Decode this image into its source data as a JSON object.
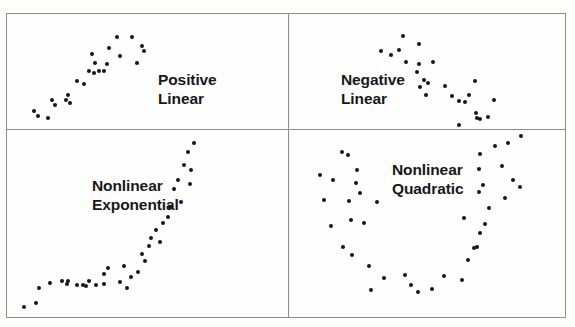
{
  "figure": {
    "type": "scatterplot-matrix",
    "colors": {
      "background": "#fdfdfc",
      "panel_background": "#fefefe",
      "border": "#8d8d8d",
      "dot": "#161616",
      "label_text": "#18181a"
    },
    "grid": {
      "rows": 2,
      "columns": 2
    }
  },
  "panels": [
    {
      "id": "positive-linear",
      "position": "top-left",
      "label_lines": [
        "Positive",
        "Linear"
      ],
      "label_line_1": "Positive",
      "label_line_2": "Linear",
      "points": [
        [
          26,
          96
        ],
        [
          30,
          101
        ],
        [
          40,
          103
        ],
        [
          44,
          85
        ],
        [
          47,
          90
        ],
        [
          58,
          85
        ],
        [
          60,
          80
        ],
        [
          62,
          88
        ],
        [
          69,
          66
        ],
        [
          76,
          69
        ],
        [
          81,
          56
        ],
        [
          86,
          58
        ],
        [
          91,
          56
        ],
        [
          96,
          56
        ],
        [
          84,
          39
        ],
        [
          87,
          48
        ],
        [
          99,
          49
        ],
        [
          101,
          33
        ],
        [
          109,
          22
        ],
        [
          112,
          41
        ],
        [
          124,
          22
        ],
        [
          129,
          48
        ],
        [
          134,
          31
        ],
        [
          136,
          36
        ]
      ]
    },
    {
      "id": "negative-linear",
      "position": "top-right",
      "label_lines": [
        "Negative",
        "Linear"
      ],
      "label_line_1": "Negative",
      "label_line_2": "Linear",
      "points": [
        [
          92,
          36
        ],
        [
          102,
          40
        ],
        [
          110,
          35
        ],
        [
          114,
          21
        ],
        [
          117,
          47
        ],
        [
          130,
          29
        ],
        [
          128,
          57
        ],
        [
          130,
          49
        ],
        [
          144,
          47
        ],
        [
          135,
          65
        ],
        [
          131,
          72
        ],
        [
          137,
          80
        ],
        [
          139,
          68
        ],
        [
          156,
          71
        ],
        [
          163,
          81
        ],
        [
          170,
          86
        ],
        [
          176,
          87
        ],
        [
          180,
          80
        ],
        [
          186,
          66
        ],
        [
          187,
          98
        ],
        [
          188,
          103
        ],
        [
          191,
          104
        ],
        [
          199,
          102
        ],
        [
          205,
          85
        ],
        [
          170,
          110
        ]
      ]
    },
    {
      "id": "nonlinear-exponential",
      "position": "bottom-left",
      "label_lines": [
        "Nonlinear",
        "Exponential"
      ],
      "label_line_1": "Nonlinear",
      "label_line_2": "Exponential",
      "points": [
        [
          16,
          177
        ],
        [
          28,
          173
        ],
        [
          31,
          158
        ],
        [
          42,
          153
        ],
        [
          54,
          151
        ],
        [
          59,
          154
        ],
        [
          60,
          151
        ],
        [
          69,
          155
        ],
        [
          75,
          155
        ],
        [
          78,
          156
        ],
        [
          81,
          151
        ],
        [
          88,
          155
        ],
        [
          96,
          154
        ],
        [
          96,
          144
        ],
        [
          100,
          138
        ],
        [
          112,
          152
        ],
        [
          116,
          136
        ],
        [
          119,
          158
        ],
        [
          123,
          147
        ],
        [
          130,
          142
        ],
        [
          134,
          124
        ],
        [
          137,
          131
        ],
        [
          141,
          116
        ],
        [
          143,
          108
        ],
        [
          148,
          100
        ],
        [
          152,
          112
        ],
        [
          155,
          93
        ],
        [
          160,
          87
        ],
        [
          162,
          77
        ],
        [
          166,
          59
        ],
        [
          170,
          50
        ],
        [
          173,
          72
        ],
        [
          176,
          35
        ],
        [
          180,
          22
        ],
        [
          182,
          54
        ],
        [
          183,
          40
        ],
        [
          186,
          13
        ]
      ]
    },
    {
      "id": "nonlinear-quadratic",
      "position": "bottom-right",
      "label_lines": [
        "Nonlinear",
        "Quadratic"
      ],
      "label_line_1": "Nonlinear",
      "label_line_2": "Quadratic",
      "points": [
        [
          31,
          45
        ],
        [
          53,
          22
        ],
        [
          59,
          25
        ],
        [
          44,
          50
        ],
        [
          68,
          40
        ],
        [
          67,
          53
        ],
        [
          71,
          63
        ],
        [
          35,
          70
        ],
        [
          60,
          71
        ],
        [
          88,
          72
        ],
        [
          62,
          90
        ],
        [
          42,
          96
        ],
        [
          75,
          93
        ],
        [
          54,
          117
        ],
        [
          63,
          125
        ],
        [
          80,
          136
        ],
        [
          95,
          148
        ],
        [
          82,
          160
        ],
        [
          116,
          145
        ],
        [
          122,
          155
        ],
        [
          129,
          162
        ],
        [
          155,
          146
        ],
        [
          143,
          159
        ],
        [
          173,
          150
        ],
        [
          179,
          130
        ],
        [
          185,
          118
        ],
        [
          188,
          117
        ],
        [
          175,
          88
        ],
        [
          191,
          103
        ],
        [
          196,
          94
        ],
        [
          200,
          78
        ],
        [
          190,
          62
        ],
        [
          194,
          55
        ],
        [
          190,
          39
        ],
        [
          191,
          24
        ],
        [
          206,
          16
        ],
        [
          213,
          36
        ],
        [
          219,
          13
        ],
        [
          216,
          68
        ],
        [
          224,
          50
        ],
        [
          232,
          6
        ],
        [
          231,
          57
        ]
      ]
    }
  ]
}
